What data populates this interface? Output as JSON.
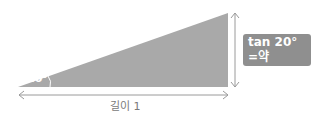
{
  "diagram": {
    "angle_label": "20°",
    "length_label": "길이 1",
    "result_line1": "tan 20°",
    "result_line2": "=약 0.364",
    "colors": {
      "triangle": "#a9a9a9",
      "arrows": "#9a9a9a",
      "label_bg": "#8f8f8f",
      "label_text": "#ffffff"
    }
  }
}
